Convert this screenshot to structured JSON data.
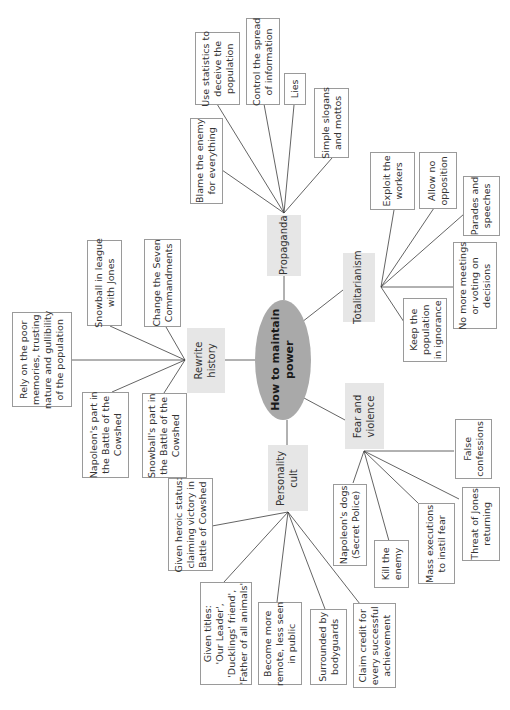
{
  "diagram": {
    "orientation": "rotated-90-ccw",
    "center": {
      "label": "How to maintain\npower"
    },
    "branches": {
      "propaganda": {
        "label": "Propaganda",
        "items": [
          "Blame the enemy\nfor everything",
          "Use statistics to\ndeceive the\npopulation",
          "Control the spread\nof information",
          "Lies",
          "Simple slogans\nand mottos"
        ]
      },
      "totalitarianism": {
        "label": "Totalitarianism",
        "items": [
          "Exploit the\nworkers",
          "Allow no\nopposition",
          "Parades and\nspeeches",
          "No more meetings\nor voting on\ndecisions",
          "Keep the\npopulation\nin ignorance"
        ]
      },
      "fear_and_violence": {
        "label": "Fear and\nviolence",
        "items": [
          "False\nconfessions",
          "Threat of Jones\nreturning",
          "Mass executions\nto instil fear",
          "Kill the\nenemy",
          "Napoleon's dogs\n(Secret Police)"
        ]
      },
      "personality_cult": {
        "label": "Personality\ncult",
        "items": [
          "Claim credit for\nevery successful\nachievement",
          "Surrounded by\nbodyguards",
          "Become more\nremote, less seen\nin public",
          "Given titles:\n'Our Leader',\n'Ducklings' friend',\n'Father of all animals'",
          "Given heroic status:\nclaiming victory in\nBattle of Cowshed"
        ]
      },
      "rewrite_history": {
        "label": "Rewrite\nhistory",
        "items": [
          "Snowball's part in\nthe Battle of the\nCowshed",
          "Napoleon's part in\nthe Battle of the\nCowshed",
          "Rely on the poor\nmemories, trusting\nnature and gullibility\nof the population",
          "Snowball in league\nwith Jones",
          "Change the Seven\nCommandments"
        ]
      }
    }
  }
}
